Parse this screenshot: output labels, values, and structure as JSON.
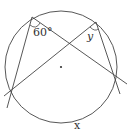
{
  "diagram": {
    "type": "circle-inscribed-angles",
    "circle": {
      "cx": 61,
      "cy": 67,
      "r": 56
    },
    "points": {
      "A": {
        "x": 32,
        "y": 17
      },
      "B": {
        "x": 96,
        "y": 22
      },
      "C": {
        "x": 11,
        "y": 91
      },
      "D": {
        "x": 116,
        "y": 77
      }
    },
    "labels": {
      "angle_a": "60°",
      "angle_b": "y",
      "arc": "x"
    },
    "colors": {
      "stroke": "#444444",
      "text": "#333333"
    }
  }
}
